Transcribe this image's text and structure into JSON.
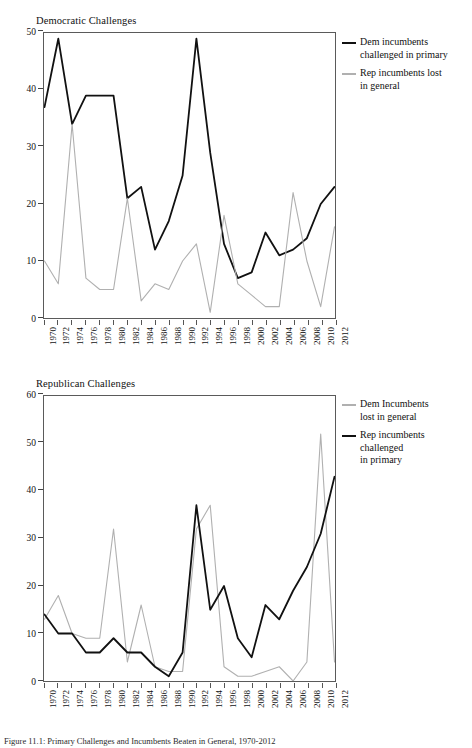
{
  "figure": {
    "caption": "Figure 11.1: Primary Challenges and Incumbents Beaten in General, 1970-2012"
  },
  "panels": [
    {
      "id": "democratic",
      "title": "Democratic Challenges",
      "legend": [
        {
          "key": "dem-primary",
          "label": "Dem incumbents\nchallenged in primary",
          "color": "#111111",
          "style": "dark"
        },
        {
          "key": "rep-general",
          "label": "Rep incumbents lost\nin general",
          "color": "#b0b0b0",
          "style": "light"
        }
      ]
    },
    {
      "id": "republican",
      "title": "Republican Challenges",
      "legend": [
        {
          "key": "dem-general",
          "label": "Dem Incumbents\nlost in general",
          "color": "#b0b0b0",
          "style": "light"
        },
        {
          "key": "rep-primary",
          "label": "Rep incumbents\nchallenged\nin primary",
          "color": "#111111",
          "style": "dark"
        }
      ]
    }
  ],
  "chart_data": [
    {
      "id": "democratic",
      "type": "line",
      "title": "Democratic Challenges",
      "xlabel": "",
      "ylabel": "",
      "grid": false,
      "legend_position": "right",
      "categories": [
        "1970",
        "1972",
        "1974",
        "1976",
        "1978",
        "1980",
        "1982",
        "1984",
        "1986",
        "1988",
        "1990",
        "1992",
        "1994",
        "1996",
        "1998",
        "2000",
        "2002",
        "2004",
        "2006",
        "2008",
        "2010",
        "2012"
      ],
      "xlim": [
        1970,
        2012
      ],
      "ylim": [
        0,
        50
      ],
      "yticks": [
        0,
        10,
        20,
        30,
        40,
        50
      ],
      "series": [
        {
          "name": "Dem incumbents challenged in primary",
          "color": "#111111",
          "values": [
            37,
            49,
            34,
            39,
            39,
            39,
            21,
            23,
            12,
            17,
            25,
            49,
            29,
            13,
            7,
            8,
            15,
            11,
            12,
            14,
            20,
            23
          ]
        },
        {
          "name": "Rep incumbents lost in general",
          "color": "#b0b0b0",
          "values": [
            10,
            6,
            34,
            7,
            5,
            5,
            21,
            3,
            6,
            5,
            10,
            13,
            1,
            18,
            6,
            4,
            2,
            2,
            22,
            10,
            2,
            16
          ]
        }
      ]
    },
    {
      "id": "republican",
      "type": "line",
      "title": "Republican Challenges",
      "xlabel": "",
      "ylabel": "",
      "grid": false,
      "legend_position": "right",
      "categories": [
        "1970",
        "1972",
        "1974",
        "1976",
        "1978",
        "1980",
        "1982",
        "1984",
        "1986",
        "1988",
        "1990",
        "1992",
        "1994",
        "1996",
        "1998",
        "2000",
        "2002",
        "2004",
        "2006",
        "2008",
        "2010",
        "2012"
      ],
      "xlim": [
        1970,
        2012
      ],
      "ylim": [
        0,
        60
      ],
      "yticks": [
        0,
        10,
        20,
        30,
        40,
        50,
        60
      ],
      "series": [
        {
          "name": "Dem Incumbents lost in general",
          "color": "#b0b0b0",
          "values": [
            13,
            18,
            10,
            9,
            9,
            32,
            4,
            16,
            3,
            2,
            2,
            32,
            37,
            3,
            1,
            1,
            2,
            3,
            0,
            4,
            52,
            4
          ]
        },
        {
          "name": "Rep incumbents challenged in primary",
          "color": "#111111",
          "values": [
            14,
            10,
            10,
            6,
            6,
            9,
            6,
            6,
            3,
            1,
            6,
            37,
            15,
            20,
            9,
            5,
            16,
            13,
            19,
            24,
            31,
            43
          ]
        }
      ]
    }
  ]
}
